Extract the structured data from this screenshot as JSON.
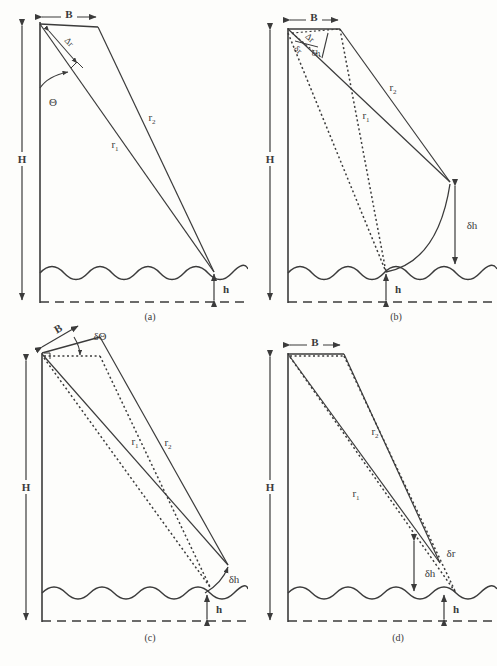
{
  "figure": {
    "background_color": "#fdfdfb",
    "line_color": "#3b3b3b",
    "panel_count": 4
  },
  "symbols": {
    "tower_height": "H",
    "baseline": "B",
    "range_near": "r",
    "range_far": "r",
    "range_near_sub": "1",
    "range_far_sub": "2",
    "sea_height": "h",
    "look_angle": "Θ",
    "range_difference": "Δr",
    "range_error": "δr",
    "height_error": "δh",
    "angle_error": "δΘ"
  },
  "panels": [
    {
      "id": "a",
      "caption": "(a)",
      "labels": {
        "height": "H",
        "baseline": "B",
        "r1": "r",
        "r1_sub": "1",
        "r2": "r",
        "r2_sub": "2",
        "sea_height": "h",
        "theta": "Θ",
        "delta_r": "Δr"
      }
    },
    {
      "id": "b",
      "caption": "(b)",
      "labels": {
        "height": "H",
        "baseline": "B",
        "r1": "r",
        "r1_sub": "1",
        "r2": "r",
        "r2_sub": "2",
        "sea_height": "h",
        "delta_r": "Δr",
        "small_delta_r": "δr",
        "delta_h": "δh"
      }
    },
    {
      "id": "c",
      "caption": "(c)",
      "labels": {
        "height": "H",
        "baseline": "B",
        "r1": "r",
        "r1_sub": "1",
        "r2": "r",
        "r2_sub": "2",
        "sea_height": "h",
        "delta_theta": "δΘ",
        "delta_h": "δh"
      }
    },
    {
      "id": "d",
      "caption": "(d)",
      "labels": {
        "height": "H",
        "baseline": "B",
        "r1": "r",
        "r1_sub": "1",
        "r2": "r",
        "r2_sub": "2",
        "sea_height": "h",
        "delta_r": "δr",
        "delta_h": "δh"
      }
    }
  ]
}
